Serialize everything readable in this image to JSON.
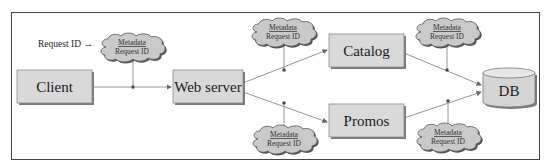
{
  "diagram": {
    "entry_label": "Request ID →",
    "nodes": {
      "client": "Client",
      "web_server": "Web server",
      "catalog": "Catalog",
      "promos": "Promos",
      "db": "DB"
    },
    "metadata_clouds": [
      {
        "title": "Metadata",
        "subtitle": "Request ID",
        "edge": "Client → Web server"
      },
      {
        "title": "Metadata",
        "subtitle": "Request ID",
        "edge": "Web server → Catalog"
      },
      {
        "title": "Metadata",
        "subtitle": "Request ID",
        "edge": "Catalog → DB"
      },
      {
        "title": "Metadata",
        "subtitle": "Request ID",
        "edge": "Web server → Promos"
      },
      {
        "title": "Metadata",
        "subtitle": "Request ID",
        "edge": "Promos → DB"
      }
    ],
    "edges": [
      {
        "from": "Client",
        "to": "Web server"
      },
      {
        "from": "Web server",
        "to": "Catalog"
      },
      {
        "from": "Web server",
        "to": "Promos"
      },
      {
        "from": "Catalog",
        "to": "DB"
      },
      {
        "from": "Promos",
        "to": "DB"
      }
    ],
    "colors": {
      "box_fill": "#d9d9d9",
      "box_shadow": "#7a7a7a",
      "cloud_fill": "#c9c9c9",
      "cloud_stroke": "#555555",
      "line": "#8a8a8a",
      "frame": "#444444"
    }
  }
}
